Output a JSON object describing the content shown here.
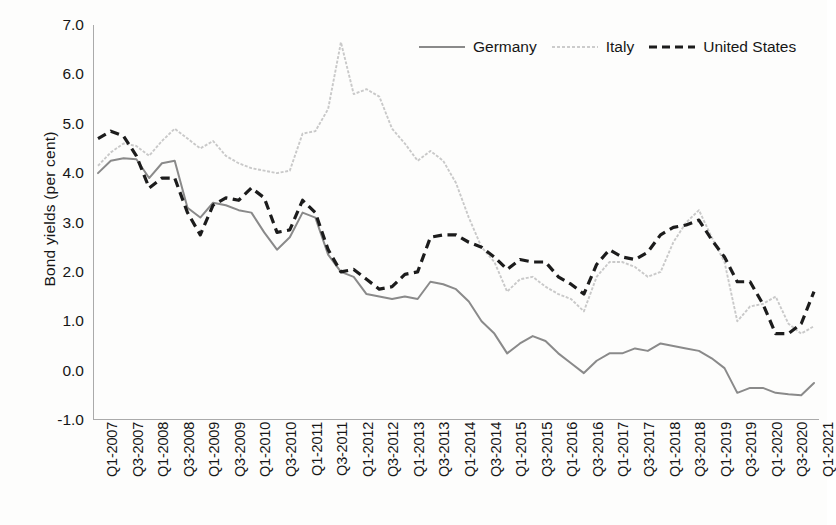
{
  "chart_data": {
    "type": "line",
    "title": "",
    "xlabel": "",
    "ylabel": "Bond yields (per cent)",
    "ylim": [
      -1.0,
      7.0
    ],
    "ytick_labels": [
      "7.0",
      "6.0",
      "5.0",
      "4.0",
      "3.0",
      "2.0",
      "1.0",
      "0.0",
      "-1.0"
    ],
    "ytick_values": [
      7.0,
      6.0,
      5.0,
      4.0,
      3.0,
      2.0,
      1.0,
      0.0,
      -1.0
    ],
    "grid": false,
    "legend_position": "top-right",
    "x_tick_labels": [
      "Q1-2007",
      "Q3-2007",
      "Q1-2008",
      "Q3-2008",
      "Q1-2009",
      "Q3-2009",
      "Q1-2010",
      "Q3-2010",
      "Q1-2011",
      "Q3-2011",
      "Q1-2012",
      "Q3-2012",
      "Q1-2013",
      "Q3-2013",
      "Q1-2014",
      "Q3-2014",
      "Q1-2015",
      "Q3-2015",
      "Q1-2016",
      "Q3-2016",
      "Q1-2017",
      "Q3-2017",
      "Q1-2018",
      "Q3-2018",
      "Q1-2019",
      "Q3-2019",
      "Q1-2020",
      "Q3-2020",
      "Q1-2021"
    ],
    "x": [
      "Q1-2007",
      "Q2-2007",
      "Q3-2007",
      "Q4-2007",
      "Q1-2008",
      "Q2-2008",
      "Q3-2008",
      "Q4-2008",
      "Q1-2009",
      "Q2-2009",
      "Q3-2009",
      "Q4-2009",
      "Q1-2010",
      "Q2-2010",
      "Q3-2010",
      "Q4-2010",
      "Q1-2011",
      "Q2-2011",
      "Q3-2011",
      "Q4-2011",
      "Q1-2012",
      "Q2-2012",
      "Q3-2012",
      "Q4-2012",
      "Q1-2013",
      "Q2-2013",
      "Q3-2013",
      "Q4-2013",
      "Q1-2014",
      "Q2-2014",
      "Q3-2014",
      "Q4-2014",
      "Q1-2015",
      "Q2-2015",
      "Q3-2015",
      "Q4-2015",
      "Q1-2016",
      "Q2-2016",
      "Q3-2016",
      "Q4-2016",
      "Q1-2017",
      "Q2-2017",
      "Q3-2017",
      "Q4-2017",
      "Q1-2018",
      "Q2-2018",
      "Q3-2018",
      "Q4-2018",
      "Q1-2019",
      "Q2-2019",
      "Q3-2019",
      "Q4-2019",
      "Q1-2020",
      "Q2-2020",
      "Q3-2020",
      "Q4-2020",
      "Q1-2021"
    ],
    "series": [
      {
        "name": "Germany",
        "style": "solid",
        "color": "#8a8a8a",
        "values": [
          4.0,
          4.25,
          4.3,
          4.28,
          3.9,
          4.2,
          4.25,
          3.3,
          3.1,
          3.4,
          3.35,
          3.25,
          3.2,
          2.8,
          2.45,
          2.7,
          3.2,
          3.1,
          2.35,
          2.0,
          1.9,
          1.55,
          1.5,
          1.45,
          1.5,
          1.45,
          1.8,
          1.75,
          1.65,
          1.4,
          1.0,
          0.75,
          0.35,
          0.55,
          0.7,
          0.6,
          0.35,
          0.15,
          -0.05,
          0.2,
          0.35,
          0.35,
          0.45,
          0.4,
          0.55,
          0.5,
          0.45,
          0.4,
          0.25,
          0.05,
          -0.45,
          -0.35,
          -0.35,
          -0.45,
          -0.48,
          -0.5,
          -0.25
        ]
      },
      {
        "name": "Italy",
        "style": "dotted",
        "color": "#c9c9c9",
        "values": [
          4.15,
          4.42,
          4.6,
          4.55,
          4.35,
          4.65,
          4.9,
          4.7,
          4.5,
          4.65,
          4.35,
          4.2,
          4.1,
          4.05,
          4.0,
          4.05,
          4.8,
          4.85,
          5.3,
          6.65,
          5.6,
          5.7,
          5.55,
          4.9,
          4.6,
          4.25,
          4.45,
          4.25,
          3.8,
          3.1,
          2.5,
          2.2,
          1.6,
          1.85,
          1.9,
          1.7,
          1.55,
          1.45,
          1.2,
          1.9,
          2.2,
          2.2,
          2.1,
          1.9,
          2.0,
          2.6,
          3.0,
          3.25,
          2.7,
          2.2,
          1.0,
          1.3,
          1.35,
          1.5,
          0.95,
          0.75,
          0.9
        ]
      },
      {
        "name": "United States",
        "style": "dashed",
        "color": "#1c1c1c",
        "values": [
          4.7,
          4.85,
          4.75,
          4.35,
          3.7,
          3.9,
          3.9,
          3.2,
          2.75,
          3.35,
          3.5,
          3.45,
          3.7,
          3.5,
          2.8,
          2.85,
          3.45,
          3.2,
          2.45,
          2.0,
          2.05,
          1.85,
          1.65,
          1.7,
          1.95,
          2.0,
          2.7,
          2.75,
          2.75,
          2.6,
          2.5,
          2.3,
          2.05,
          2.25,
          2.2,
          2.2,
          1.9,
          1.75,
          1.55,
          2.15,
          2.45,
          2.3,
          2.25,
          2.4,
          2.75,
          2.9,
          2.95,
          3.05,
          2.65,
          2.3,
          1.8,
          1.8,
          1.35,
          0.75,
          0.75,
          0.95,
          1.6
        ]
      }
    ]
  },
  "legend": {
    "items": [
      {
        "label": "Germany",
        "style": "solid"
      },
      {
        "label": "Italy",
        "style": "dotted"
      },
      {
        "label": "United States",
        "style": "dashed"
      }
    ]
  }
}
